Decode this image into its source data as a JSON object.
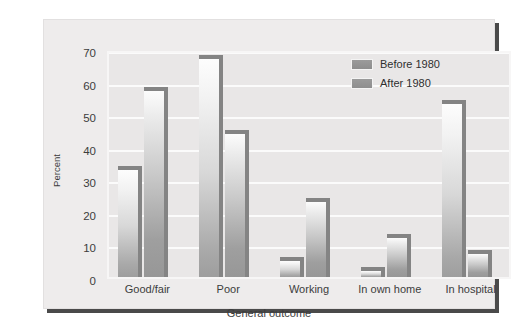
{
  "chart_data": {
    "type": "bar",
    "title": "",
    "xlabel": "General outcome",
    "ylabel": "Percent",
    "categories": [
      "Good/fair",
      "Poor",
      "Working",
      "In own home",
      "In hospital"
    ],
    "series": [
      {
        "name": "Before 1980",
        "values": [
          33,
          67,
          5,
          2,
          53
        ]
      },
      {
        "name": "After 1980",
        "values": [
          57,
          44,
          23,
          12,
          7
        ]
      }
    ],
    "ylim": [
      0,
      70
    ],
    "yticks": [
      0,
      10,
      20,
      30,
      40,
      50,
      60,
      70
    ],
    "ytick_labels": [
      "0",
      "10",
      "20",
      "30",
      "40",
      "50",
      "60",
      "70"
    ],
    "grid": "horizontal",
    "legend_position": "top-right",
    "colors": {
      "bar_top": "#fdfdfd",
      "bar_bottom": "#9e9e9e",
      "bar_cap": "#848484",
      "plot_background": "#e9e7e7",
      "gridline": "#fbfbfb",
      "panel_background": "#eeecec",
      "text": "#3c3c3c"
    }
  },
  "legend": {
    "entries": [
      {
        "label": "Before 1980",
        "swatch": "legend-swatch-before-1980"
      },
      {
        "label": "After 1980",
        "swatch": "legend-swatch-after-1980"
      }
    ]
  }
}
